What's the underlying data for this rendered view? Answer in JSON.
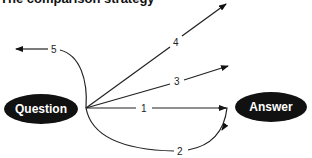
{
  "title": "The comparison strategy",
  "nodes": {
    "question": {
      "label": "Question",
      "fill": "#111111"
    },
    "answer": {
      "label": "Answer",
      "fill": "#111111"
    }
  },
  "edges": [
    {
      "id": "1",
      "label": "1",
      "from": "Question",
      "to": "Answer",
      "shape": "straight"
    },
    {
      "id": "2",
      "label": "2",
      "from": "Question",
      "to": "Answer",
      "shape": "curved-below"
    },
    {
      "id": "3",
      "label": "3",
      "from": "Question",
      "to": "up-right",
      "shape": "straight"
    },
    {
      "id": "4",
      "label": "4",
      "from": "Question",
      "to": "far-up-right",
      "shape": "straight"
    },
    {
      "id": "5",
      "label": "5",
      "from": "Question",
      "to": "left",
      "shape": "curved-up-left"
    }
  ]
}
